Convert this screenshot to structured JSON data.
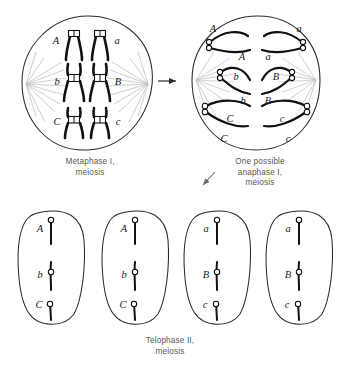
{
  "figure": {
    "type": "biology-diagram"
  },
  "captions": {
    "metaphase": {
      "line1": "Metaphase I,",
      "line2": "meiosis"
    },
    "anaphase": {
      "line1": "One possible",
      "line2": "anaphase I,",
      "line3": "meiosis"
    },
    "telophase": {
      "line1": "Telophase II,",
      "line2": "meiosis"
    }
  },
  "cells": {
    "metaphase_i": {
      "name": "Metaphase I cell",
      "pairs": [
        {
          "row": "top",
          "left_label": "A",
          "right_label": "a",
          "centromere": "top"
        },
        {
          "row": "middle",
          "left_label": "b",
          "right_label": "B",
          "centromere": "middle"
        },
        {
          "row": "bottom",
          "left_label": "C",
          "right_label": "c",
          "centromere": "upper-middle"
        }
      ]
    },
    "anaphase_i": {
      "name": "One possible anaphase I cell",
      "pairs": [
        {
          "row": "top",
          "left_labels": [
            "A",
            "A"
          ],
          "right_labels": [
            "a",
            "a"
          ]
        },
        {
          "row": "middle",
          "left_labels": [
            "b",
            "b"
          ],
          "right_labels": [
            "B",
            "B"
          ]
        },
        {
          "row": "bottom",
          "left_labels": [
            "C",
            "C"
          ],
          "right_labels": [
            "c",
            "c"
          ]
        }
      ]
    },
    "telophase_ii": [
      {
        "index": 1,
        "labels": [
          "A",
          "b",
          "C"
        ]
      },
      {
        "index": 2,
        "labels": [
          "A",
          "b",
          "C"
        ]
      },
      {
        "index": 3,
        "labels": [
          "a",
          "B",
          "c"
        ]
      },
      {
        "index": 4,
        "labels": [
          "a",
          "B",
          "c"
        ]
      }
    ]
  },
  "arrows": {
    "metaphase_to_anaphase": "right-arrow",
    "anaphase_to_telophase": "down-left-arrow"
  },
  "colors": {
    "outline": "#2b2b2b",
    "chromosome": "#111111",
    "spindle": "#b9b9b9",
    "caption": "#55575a",
    "background": "#ffffff"
  }
}
